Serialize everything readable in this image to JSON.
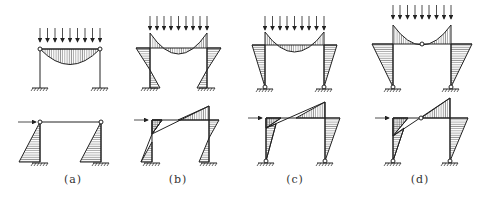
{
  "figure": {
    "panels": [
      {
        "id": "a",
        "label": "(a)",
        "description": "Two-hinged beam on fixed columns (pinned beam ends)"
      },
      {
        "id": "b",
        "label": "(b)",
        "description": "Rigid frame, fixed bases"
      },
      {
        "id": "c",
        "label": "(c)",
        "description": "Rigid frame, pinned bases"
      },
      {
        "id": "d",
        "label": "(d)",
        "description": "Three-hinged frame, pinned bases, hinge at beam midspan"
      }
    ],
    "rows": [
      {
        "id": "top",
        "load": "uniformly distributed vertical load"
      },
      {
        "id": "bottom",
        "load": "horizontal point load at beam level"
      }
    ],
    "colors": {
      "line": "#222222",
      "hatch": "#555555",
      "background": "#ffffff"
    }
  }
}
